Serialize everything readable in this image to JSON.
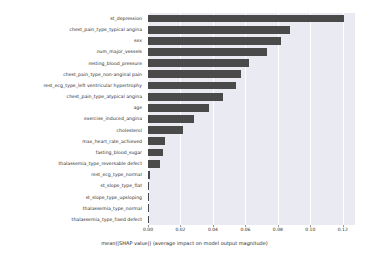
{
  "chart_data": {
    "type": "bar",
    "orientation": "horizontal",
    "title": "",
    "xlabel": "mean(|SHAP value|) (average impact on model output magnitude)",
    "ylabel": "",
    "xlim": [
      0,
      0.1275
    ],
    "xticks": [
      0.0,
      0.02,
      0.04,
      0.06,
      0.08,
      0.1,
      0.12
    ],
    "xtick_labels": [
      "0.00",
      "0.02",
      "0.04",
      "0.06",
      "0.08",
      "0.10",
      "0.12"
    ],
    "grid": true,
    "grid_axis": "x",
    "legend": null,
    "bar_color": "#4a4a4a",
    "plot_background": "#eaeaf2",
    "categories": [
      "st_depression",
      "chest_pain_type_typical angina",
      "sex",
      "num_major_vessels",
      "resting_blood_pressure",
      "chest_pain_type_non-anginal pain",
      "rest_ecg_type_left ventricular hypertrophy",
      "chest_pain_type_atypical angina",
      "age",
      "exercise_induced_angina",
      "cholesterol",
      "max_heart_rate_achieved",
      "fasting_blood_sugar",
      "thalassemia_type_reversable defect",
      "rest_ecg_type_normal",
      "st_slope_type_flat",
      "st_slope_type_upsloping",
      "thalassemia_type_normal",
      "thalassemia_type_fixed defect"
    ],
    "values": [
      0.1205,
      0.0875,
      0.082,
      0.073,
      0.0625,
      0.057,
      0.0545,
      0.046,
      0.0375,
      0.0285,
      0.0215,
      0.0105,
      0.0095,
      0.0075,
      0.0012,
      0.0008,
      0.0006,
      0.0005,
      0.0004
    ]
  }
}
